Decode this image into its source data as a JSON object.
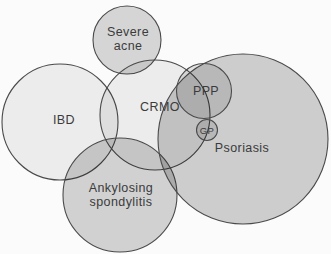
{
  "figure": {
    "type": "euler-venn-diagram",
    "background": "#fbfbfb",
    "stroke_color": "#4a4a4a",
    "stroke_width": 1.1,
    "text_color": "#3b3b3b",
    "line_height": 13.5,
    "circles": [
      {
        "id": "ibd",
        "label_lines": [
          "IBD"
        ],
        "cx": 60,
        "cy": 122,
        "r": 58,
        "shade_opacity": 0.06,
        "label_x": 64,
        "label_y": 124,
        "font_size": 12.5
      },
      {
        "id": "severe-acne",
        "label_lines": [
          "Severe",
          "acne"
        ],
        "cx": 127,
        "cy": 40,
        "r": 34,
        "shade_opacity": 0.15,
        "label_x": 128,
        "label_y": 36,
        "font_size": 12.5
      },
      {
        "id": "crmo",
        "label_lines": [
          "CRMO"
        ],
        "cx": 155,
        "cy": 115,
        "r": 55,
        "shade_opacity": 0.06,
        "label_x": 160,
        "label_y": 111,
        "font_size": 12.5
      },
      {
        "id": "ankylosing-spondylitis",
        "label_lines": [
          "Ankylosing",
          "spondylitis"
        ],
        "cx": 120,
        "cy": 195,
        "r": 57,
        "shade_opacity": 0.165,
        "label_x": 121,
        "label_y": 192,
        "font_size": 12.5
      },
      {
        "id": "psoriasis",
        "label_lines": [
          "Psoriasis"
        ],
        "cx": 243,
        "cy": 139,
        "r": 85,
        "shade_opacity": 0.18,
        "label_x": 242,
        "label_y": 152,
        "font_size": 12.5
      },
      {
        "id": "ppp",
        "label_lines": [
          "PPP"
        ],
        "cx": 204,
        "cy": 91,
        "r": 27.5,
        "shade_opacity": 0.1,
        "label_x": 206,
        "label_y": 95,
        "font_size": 12.5
      },
      {
        "id": "gp",
        "label_lines": [
          "GP"
        ],
        "cx": 207,
        "cy": 130,
        "r": 10.5,
        "shade_opacity": 0.1,
        "label_x": 207,
        "label_y": 133.5,
        "font_size": 9.5
      }
    ]
  }
}
